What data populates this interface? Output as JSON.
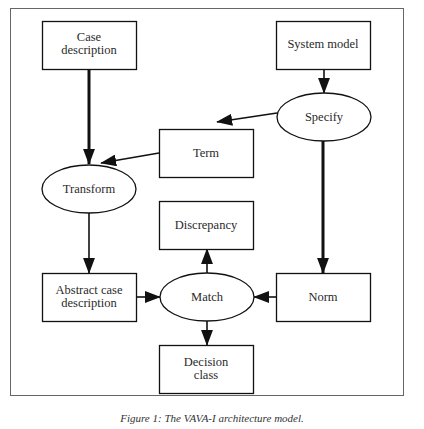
{
  "figure": {
    "caption": "Figure 1: The VAVA-I architecture model."
  },
  "nodes": {
    "case_description": {
      "shape": "rectangle",
      "lines": [
        "Case",
        "description"
      ]
    },
    "system_model": {
      "shape": "rectangle",
      "lines": [
        "System model"
      ]
    },
    "specify": {
      "shape": "ellipse",
      "lines": [
        "Specify"
      ]
    },
    "term": {
      "shape": "rectangle",
      "lines": [
        "Term"
      ]
    },
    "transform": {
      "shape": "ellipse",
      "lines": [
        "Transform"
      ]
    },
    "discrepancy": {
      "shape": "rectangle",
      "lines": [
        "Discrepancy"
      ]
    },
    "abstract_case_description": {
      "shape": "rectangle",
      "lines": [
        "Abstract case",
        "description"
      ]
    },
    "match": {
      "shape": "ellipse",
      "lines": [
        "Match"
      ]
    },
    "norm": {
      "shape": "rectangle",
      "lines": [
        "Norm"
      ]
    },
    "decision_class": {
      "shape": "rectangle",
      "lines": [
        "Decision",
        "class"
      ]
    }
  },
  "edges": [
    {
      "from": "case_description",
      "to": "transform",
      "weight": "thick"
    },
    {
      "from": "system_model",
      "to": "specify",
      "weight": "normal"
    },
    {
      "from": "specify",
      "to": "term",
      "weight": "normal"
    },
    {
      "from": "term",
      "to": "transform",
      "weight": "normal"
    },
    {
      "from": "specify",
      "to": "norm",
      "weight": "thick"
    },
    {
      "from": "transform",
      "to": "abstract_case_description",
      "weight": "normal"
    },
    {
      "from": "abstract_case_description",
      "to": "match",
      "weight": "normal"
    },
    {
      "from": "norm",
      "to": "match",
      "weight": "normal"
    },
    {
      "from": "match",
      "to": "discrepancy",
      "weight": "normal"
    },
    {
      "from": "match",
      "to": "decision_class",
      "weight": "normal"
    }
  ],
  "colors": {
    "stroke": "#1a1a1a",
    "frame": "#555555",
    "background": "#ffffff"
  }
}
